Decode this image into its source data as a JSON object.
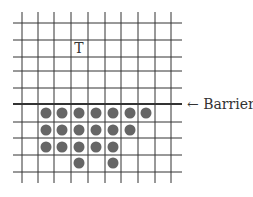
{
  "diagram": {
    "type": "grid-diagram",
    "grid": {
      "vertical_lines_x": [
        22,
        38,
        54,
        71,
        88,
        105,
        121,
        138,
        155,
        171
      ],
      "vertical_span_y": [
        12,
        183
      ],
      "horizontal_lines_y": [
        23,
        40,
        57,
        71,
        88,
        104,
        122,
        138,
        155,
        172
      ],
      "horizontal_span_x": [
        13,
        182
      ],
      "line_color": "#333333"
    },
    "barrier": {
      "line_y": 104,
      "label": "← Barrier",
      "label_x": 187,
      "label_y": 109
    },
    "target": {
      "label": "T",
      "x": 79,
      "y": 53
    },
    "dots": {
      "color": "#666666",
      "radius": 5.5,
      "rows": [
        {
          "y": 113,
          "x": [
            46,
            62,
            79,
            96,
            113,
            130,
            146
          ]
        },
        {
          "y": 130,
          "x": [
            46,
            62,
            79,
            96,
            113,
            130
          ]
        },
        {
          "y": 147,
          "x": [
            46,
            62,
            79,
            96,
            113
          ]
        },
        {
          "y": 163,
          "x": [
            79,
            113
          ]
        }
      ]
    }
  }
}
